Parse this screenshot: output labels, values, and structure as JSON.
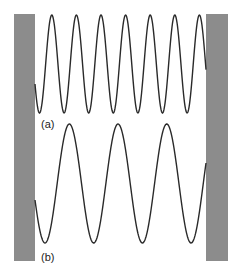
{
  "diagram": {
    "colors": {
      "background": "#ffffff",
      "wall": "#8c8c8c",
      "wave": "#2a2a2a",
      "label": "#222222"
    },
    "walls": [
      {
        "id": "left-wall",
        "x": 14,
        "y": 14,
        "width": 21,
        "height": 247
      },
      {
        "id": "right-wall",
        "x": 206,
        "y": 14,
        "width": 22,
        "height": 247
      }
    ],
    "waves": [
      {
        "id": "wave-a",
        "label": "(a)",
        "label_x": 41,
        "label_y": 128,
        "x_start": 35,
        "x_end": 206,
        "midline_y": 64,
        "amplitude": 49,
        "period": 24.6,
        "first_trough_x": 39.5,
        "peaks": 7,
        "troughs": 7
      },
      {
        "id": "wave-b",
        "label": "(b)",
        "label_x": 41,
        "label_y": 261,
        "x_start": 35,
        "x_end": 206,
        "midline_y": 183.5,
        "amplitude": 59.5,
        "period": 48.7,
        "first_trough_x": 45,
        "peaks": 3,
        "troughs": 4
      }
    ]
  }
}
